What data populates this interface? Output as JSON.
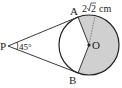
{
  "diagram": {
    "type": "geometry",
    "labels": {
      "point_a": "A",
      "point_b": "B",
      "point_p": "P",
      "center": "O",
      "angle_p": "45°",
      "radius_prefix": "2",
      "radius_sqrt": "2",
      "radius_unit": "cm"
    },
    "colors": {
      "stroke": "#222222",
      "shade": "#d0d0d0",
      "background": "#ffffff"
    }
  }
}
